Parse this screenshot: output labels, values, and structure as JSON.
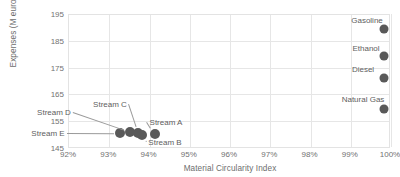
{
  "chart_data": {
    "type": "scatter",
    "title": "",
    "xlabel": "Material Circularity Index",
    "ylabel": "Expenses (M euros/year)",
    "xlim": [
      0.92,
      1.0
    ],
    "ylim": [
      145,
      195
    ],
    "xticks": [
      "92%",
      "93%",
      "94%",
      "95%",
      "96%",
      "97%",
      "98%",
      "99%",
      "100%"
    ],
    "xtick_values": [
      0.92,
      0.93,
      0.94,
      0.95,
      0.96,
      0.97,
      0.98,
      0.99,
      1.0
    ],
    "yticks": [
      "145",
      "155",
      "165",
      "175",
      "185",
      "195"
    ],
    "ytick_values": [
      145,
      155,
      165,
      175,
      185,
      195
    ],
    "grid": true,
    "legend": "none",
    "xtick_format": "percent",
    "points": [
      {
        "label": "Stream E",
        "x": 0.933,
        "y": 150.5
      },
      {
        "label": "Stream D",
        "x": 0.9355,
        "y": 151.0
      },
      {
        "label": "Stream C",
        "x": 0.9375,
        "y": 150.6
      },
      {
        "label": "Stream B",
        "x": 0.9385,
        "y": 149.8
      },
      {
        "label": "Stream A",
        "x": 0.9415,
        "y": 150.4
      },
      {
        "label": "Gasoline",
        "x": 0.9985,
        "y": 189.5
      },
      {
        "label": "Ethanol",
        "x": 0.9985,
        "y": 179.5
      },
      {
        "label": "Diesel",
        "x": 0.9985,
        "y": 171.0
      },
      {
        "label": "Natural Gas",
        "x": 0.9985,
        "y": 159.5
      }
    ],
    "annotations": [
      {
        "label": "Stream D",
        "text_x": 54,
        "text_y": 112
      },
      {
        "label": "Stream E",
        "text_x": 48,
        "text_y": 133
      },
      {
        "label": "Stream C",
        "text_x": 110,
        "text_y": 104
      },
      {
        "label": "Stream A",
        "text_x": 166,
        "text_y": 122
      },
      {
        "label": "Stream B",
        "text_x": 165,
        "text_y": 142
      },
      {
        "label": "Gasoline",
        "text_x": 367,
        "text_y": 20
      },
      {
        "label": "Ethanol",
        "text_x": 366,
        "text_y": 48
      },
      {
        "label": "Diesel",
        "text_x": 363,
        "text_y": 69
      },
      {
        "label": "Natural Gas",
        "text_x": 363,
        "text_y": 99
      }
    ],
    "marker_color": "#595959",
    "grid_color": "#e6e6e6",
    "text_color": "#6d6d6d"
  }
}
